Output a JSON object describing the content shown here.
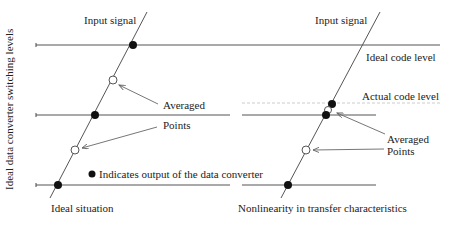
{
  "y_axis_label": "Ideal data converter switching levels",
  "left": {
    "input_signal": "Input signal",
    "averaged": "Averaged",
    "points": "Points",
    "legend": "Indicates output of the data converter",
    "caption": "Ideal situation"
  },
  "right": {
    "input_signal": "Input signal",
    "ideal_code_level": "Ideal code level",
    "actual_code_level": "Actual code level",
    "averaged": "Averaged",
    "points": "Points",
    "caption": "Nonlinearity in transfer characteristics"
  },
  "colors": {
    "line": "#444444",
    "dot": "#111111",
    "dashed": "#bbbbbb",
    "arrow": "#666666"
  }
}
